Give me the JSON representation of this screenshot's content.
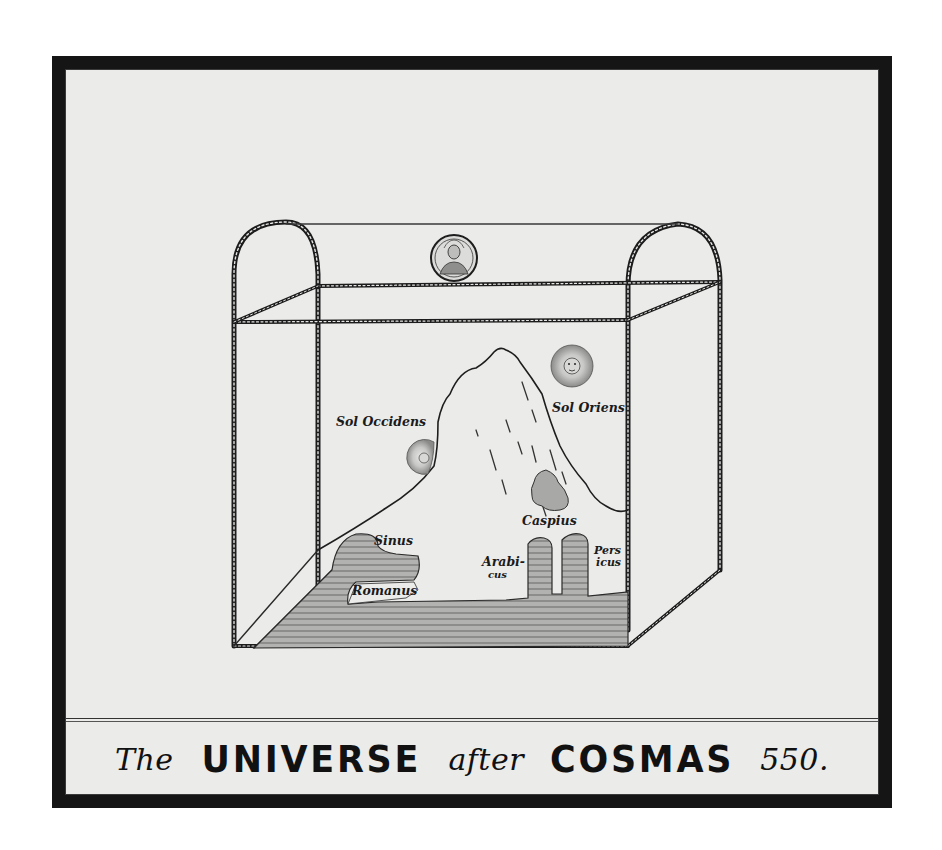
{
  "plate": {
    "title_parts": [
      {
        "text": "The",
        "style": "italic"
      },
      {
        "text": "UNIVERSE",
        "style": "bold"
      },
      {
        "text": "after",
        "style": "italic"
      },
      {
        "text": "COSMAS",
        "style": "bold"
      },
      {
        "text": "550.",
        "style": "italic"
      }
    ],
    "colors": {
      "frame": "#151515",
      "paper": "#ebebea",
      "ink": "#1a1a1a",
      "water_fill": "#a9a9a7"
    }
  },
  "illustration": {
    "labels": {
      "sol_occidens": "Sol Occidens",
      "sol_oriens": "Sol Oriens",
      "caspius": "Caspius",
      "sinus": "Sinus",
      "romanus": "Romanus",
      "arabicus_1": "Arabi-",
      "arabicus_2": "cus",
      "persicus_1": "Pers",
      "persicus_2": "icus"
    },
    "icons": {
      "medallion": "creator-medallion-icon",
      "sun_rising": "sun-face-icon",
      "sun_setting": "sun-face-icon"
    }
  }
}
